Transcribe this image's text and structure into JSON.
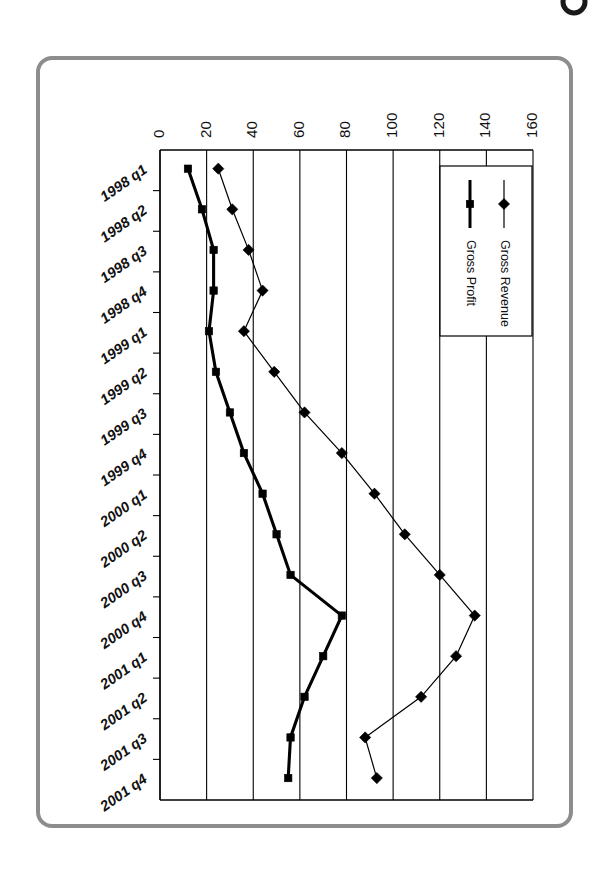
{
  "chart_data": {
    "type": "line",
    "title": "",
    "xlabel": "",
    "ylabel": "",
    "orientation": "rotated-90",
    "grid": true,
    "legend_position": "top-right-inside",
    "value_axis": {
      "min": 0,
      "max": 160,
      "step": 20,
      "ticks": [
        "0",
        "20",
        "40",
        "60",
        "80",
        "100",
        "120",
        "140",
        "160"
      ]
    },
    "categories": [
      "1998 q1",
      "1998 q2",
      "1998 q3",
      "1998 q4",
      "1999 q1",
      "1999 q2",
      "1999 q3",
      "1999 q4",
      "2000 q1",
      "2000 q2",
      "2000 q3",
      "2000 q4",
      "2001 q1",
      "2001 q2",
      "2001 q3",
      "2001 q4"
    ],
    "series": [
      {
        "name": "Gross Revenue",
        "marker": "diamond",
        "line_weight": "thin",
        "values": [
          25,
          31,
          38,
          44,
          36,
          49,
          62,
          78,
          92,
          105,
          120,
          135,
          127,
          112,
          88,
          93
        ]
      },
      {
        "name": "Gross Profit",
        "marker": "square",
        "line_weight": "thick",
        "values": [
          12,
          18,
          23,
          23,
          21,
          24,
          30,
          36,
          44,
          50,
          56,
          78,
          70,
          62,
          56,
          55
        ]
      }
    ]
  },
  "legend": {
    "entries": [
      {
        "label": "Gross Revenue",
        "marker": "diamond-marker"
      },
      {
        "label": "Gross Profit",
        "marker": "square-marker"
      }
    ]
  },
  "colors": {
    "frame": "#8d8d8d",
    "ink": "#000000",
    "background": "#ffffff"
  }
}
